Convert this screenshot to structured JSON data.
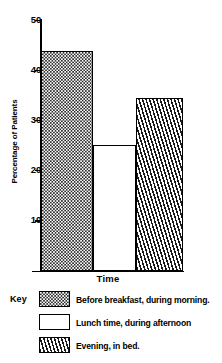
{
  "chart_data": {
    "type": "bar",
    "title": "",
    "xlabel": "Time",
    "ylabel": "Percentage of Patients",
    "categories": [
      "Before breakfast, during morning.",
      "Lunch time, during afternoon",
      "Evening, in bed."
    ],
    "values": [
      43.7,
      25.0,
      34.4
    ],
    "ylim": [
      0,
      50
    ],
    "yticks": [
      10,
      20,
      30,
      40,
      50
    ],
    "ytick_labels": [
      "10",
      "20",
      "30",
      "40",
      "50"
    ],
    "xtick_labels": [],
    "grid": false,
    "legend_position": "below",
    "series": [
      {
        "name": "Percentage of Patients",
        "values": [
          43.7,
          25.0,
          34.4
        ]
      }
    ],
    "bar_patterns": [
      "dots",
      "plain",
      "hatch"
    ]
  },
  "axes": {
    "y_title": "Percentage of Patients",
    "x_title": "Time",
    "y_tick_labels": [
      "50",
      "40",
      "30",
      "20",
      "10"
    ],
    "y_tick_values": [
      50,
      40,
      30,
      20,
      10
    ]
  },
  "bars": [
    {
      "key": "morning",
      "label": "Before breakfast, during morning.",
      "value": 43.7,
      "pattern": "dots"
    },
    {
      "key": "afternoon",
      "label": "Lunch time, during afternoon",
      "value": 25.0,
      "pattern": "plain"
    },
    {
      "key": "evening",
      "label": "Evening, in bed.",
      "value": 34.4,
      "pattern": "hatch"
    }
  ],
  "legend": {
    "title": "Key",
    "items": [
      {
        "pattern": "dots",
        "label": "Before breakfast, during morning."
      },
      {
        "pattern": "plain",
        "label": "Lunch time, during afternoon"
      },
      {
        "pattern": "hatch",
        "label": "Evening, in bed."
      }
    ]
  },
  "colors": {
    "ink": "#000000",
    "background": "#ffffff",
    "pattern_fill": "#2b2b2b"
  }
}
